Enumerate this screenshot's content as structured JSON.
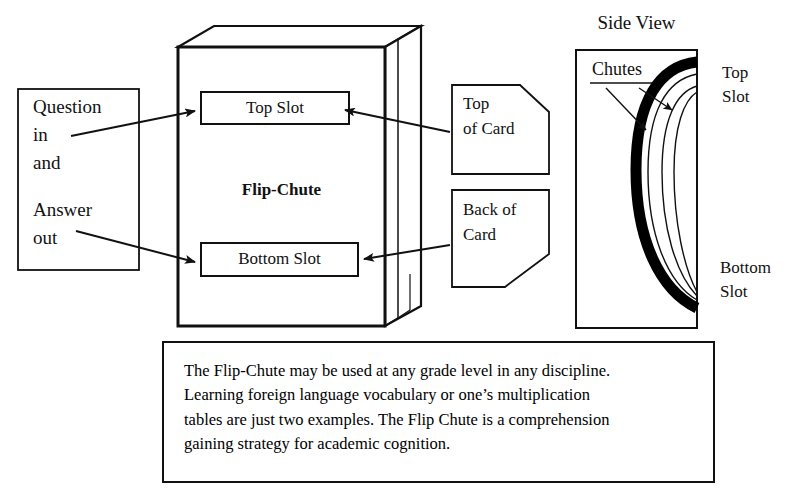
{
  "figure": {
    "title_side_view": "Side View",
    "main_box_label": "Flip-Chute",
    "top_slot_label": "Top Slot",
    "bottom_slot_label": "Bottom Slot",
    "question_box": {
      "line1": "Question",
      "line2": "in",
      "line3": "and",
      "line4": "Answer",
      "line5": "out"
    },
    "top_of_card": {
      "line1": "Top",
      "line2": "of Card"
    },
    "back_of_card": {
      "line1": "Back of",
      "line2": "Card"
    },
    "side_view": {
      "chutes_label": "Chutes",
      "top_slot_line1": "Top",
      "top_slot_line2": "Slot",
      "bottom_slot_line1": "Bottom",
      "bottom_slot_line2": "Slot"
    },
    "caption": {
      "line1": "The Flip-Chute may be used at any grade level in any discipline.",
      "line2": "Learning foreign language vocabulary or one’s multiplication",
      "line3": "tables are just two examples. The Flip Chute is a comprehension",
      "line4": "gaining strategy for academic cognition."
    }
  },
  "colors": {
    "ink": "#111111",
    "paper": "#ffffff",
    "chute_thick": "#000000"
  }
}
